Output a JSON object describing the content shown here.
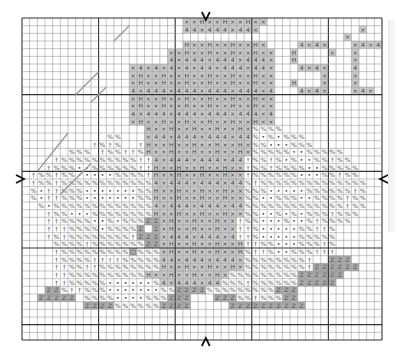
{
  "legend": {
    ".": {
      "name": "dot",
      "fill": "#ffffff",
      "glyph": "•",
      "glyph_color": "#444444"
    },
    "%": {
      "name": "percent",
      "fill": "#ffffff",
      "glyph": "%",
      "glyph_color": "#555555"
    },
    "t": {
      "name": "dagger",
      "fill": "#ffffff",
      "glyph": "†",
      "glyph_color": "#555555"
    },
    "x": {
      "name": "cross",
      "fill": "#c8c8c8",
      "glyph": "×",
      "glyph_color": "#444444"
    },
    "h": {
      "name": "h",
      "fill": "#c8c8c8",
      "glyph": "H",
      "glyph_color": "#444444"
    },
    "4": {
      "name": "four",
      "fill": "#c8c8c8",
      "glyph": "4",
      "glyph_color": "#444444"
    },
    "z": {
      "name": "z",
      "fill": "#a9a9a9",
      "glyph": "Z",
      "glyph_color": "#555555"
    },
    "o": {
      "name": "square",
      "fill": "#a9a9a9",
      "glyph": "□",
      "glyph_color": "#333333"
    },
    "w": {
      "name": "white",
      "fill": "#ffffff",
      "glyph": "",
      "glyph_color": "#000"
    },
    "-": {
      "name": "empty",
      "fill": "none",
      "glyph": "",
      "glyph_color": "#000"
    }
  },
  "grid": {
    "cols": 47,
    "rows": 42,
    "major_every": 10
  },
  "center_markers": [
    "top-arrow",
    "bottom-arrow",
    "left-arrow",
    "right-arrow"
  ],
  "rows": [
    "---------------------xxhxxhxxhxx---------------",
    "---------------------44x444x44x-------------x--",
    "------------------------------------------x--",
    "---------------------hxxhxxhxxhx----4x4x---x4x4",
    "-------------------xxhxxhxxhxxhxx--h----x--x---",
    "-------------------4x444x444x444x--h-------x---",
    "--------------x4x4x4x4x44x444x44x---4x4x---4---",
    "--------------xhxxhxxhxxhxxhxxhxx------x---x---",
    "--------------xhxxhxxhxxhxxhxxhxx--h---x---x---",
    "--------------4x444x444x444x444x4---4x4x---x4x-",
    "--------------xhxxhxxhxxhxxhxxhxx--------------",
    "--------------xhxxhxxhxxhxxhxxhxx--------------",
    "--------------4x444x444x444x444x4--------------",
    "--------------xhxxhxxhxxhxxhxxhxx--------------",
    "----------------hxxhxxhxxhxxhx%%%%-------------",
    "-----------%%---x44x444x444x44%.%.%%%----------",
    "---------t%t%--thxxhxxhxxhxxhx%%...%%%---------",
    "------%%%-t%%tt%hxxhxxhxxhxxhx%%%%%..%%%%%-----",
    "----t%%%%%%%%%%tt4x444x444x44t%%t%.%..%%t%%----",
    "---t%%%..%%%%%%tthxxhxxhxxhxxt%%t%%%%..%%%%%---",
    "-t%%t%%.....%%%%thxxhxxhxxhxxt%%%%%%...%%t%%---",
    "-t%%t%%%%%%%%%%%%4x444x444x44%t%%%%%%%%%%%%%%--",
    "-%.tt%%%.......%%hxxhxxhxxhxx%%%.....%%%%%%t%--",
    "-%.tt%%%.......%%hxxhxxhxxhxx%%..%%%..%%%%t%%--",
    "--%.%%%%%%%%%%%%%4x444x444x44%%%%%%%%%%%%%t%%--",
    "---t%%...%%%%%%%%hxxhxxhxxhxx%%..%.%.%%%t%%%---",
    "---tt%%%%..%.%%%zzxhxxhxxhxxt%%...%..%t%%%%----",
    "---ttt%%%%.%%%%zwzxhxxhxxhxxtt%.....%%tt%------",
    "---t%t%%%%%%%%tzzzx444x444x4tt%.....%%%%%------",
    "----%%%%t%%%%%%%zzxhxxhxxhxxhtt%%...%%%t%------",
    "----t%%%%%%%%%o%%%xhxxhxxhxxh%tt%..%%%ttt------",
    "----t%%%%tttt%%%%%44x444x444x%%%%%%%%t--zzz----",
    "----tt%%tt%%%%%%%%hxxhxxhxxhx%%%%%%%%tzzzzzz---",
    "----tt%%%%%%%%%%hxxhxxhxxhx%%%%%%%%%zzzzzz-----",
    "----tt%%%%%......%4x444x44%%%t%%%%%%zzzzz------",
    "---zz%tt%%%.......%%zzzz%%%%%%%%%zzz-----------",
    "--zzzzz-%%%%....%%%zzz---zzz%%t%%%zz-----------",
    "--------zzzz%%%%%%zzzz-----zzzzzzzzzz----------",
    "-----------------------------------------------",
    "-----------------------------------------------",
    "-----------------------------------------------",
    "-----------------------------------------------"
  ],
  "backstitch": [
    {
      "name": "steam-1",
      "points": [
        [
          12,
          3
        ],
        [
          14,
          1
        ]
      ]
    },
    {
      "name": "steam-2",
      "points": [
        [
          7,
          10
        ],
        [
          10,
          7
        ]
      ]
    },
    {
      "name": "steam-3",
      "points": [
        [
          9,
          11
        ],
        [
          11,
          9
        ]
      ]
    },
    {
      "name": "steam-4",
      "points": [
        [
          2,
          20
        ],
        [
          6,
          15
        ]
      ]
    },
    {
      "name": "steam-5",
      "points": [
        [
          5,
          23
        ],
        [
          9,
          19
        ]
      ]
    }
  ]
}
